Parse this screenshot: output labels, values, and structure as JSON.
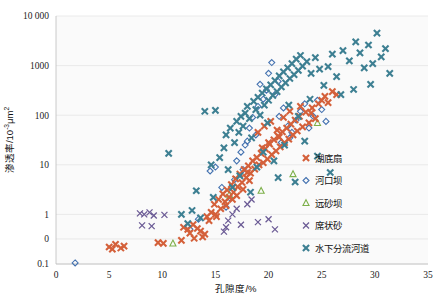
{
  "chart_data": {
    "type": "scatter",
    "title": "",
    "xlabel": "孔隙度/%",
    "ylabel": "渗透率/10⁻³μm²",
    "ylabel_base": "渗透率/10",
    "ylabel_exp": "-3",
    "ylabel_unit": "μm",
    "ylabel_unit_exp": "2",
    "xlim": [
      0,
      35
    ],
    "ylim": [
      0.1,
      10000
    ],
    "yscale": "log",
    "xscale": "linear",
    "grid": "horizontal",
    "legend_position": "right-center",
    "xticks": [
      "0",
      "5",
      "10",
      "15",
      "20",
      "25",
      "30",
      "35"
    ],
    "xtick_values": [
      0,
      5,
      10,
      15,
      20,
      25,
      30,
      35
    ],
    "yticks": [
      "10 000",
      "1000",
      "100",
      "10",
      "1",
      "0",
      "0.1"
    ],
    "ytick_values": [
      10000,
      1000,
      100,
      10,
      1,
      0.32,
      0.1
    ],
    "series": [
      {
        "name": "湖底扇",
        "marker": "heavy-x",
        "color": "#d4603a",
        "points": [
          [
            5.0,
            0.22
          ],
          [
            5.3,
            0.2
          ],
          [
            5.6,
            0.25
          ],
          [
            6.1,
            0.21
          ],
          [
            6.4,
            0.23
          ],
          [
            9.6,
            0.27
          ],
          [
            10.1,
            0.26
          ],
          [
            12.0,
            0.55
          ],
          [
            12.4,
            0.5
          ],
          [
            12.9,
            0.62
          ],
          [
            13.3,
            0.52
          ],
          [
            13.6,
            0.46
          ],
          [
            14.0,
            0.4
          ],
          [
            14.4,
            0.75
          ],
          [
            14.6,
            1.1
          ],
          [
            14.9,
            1.6
          ],
          [
            15.1,
            0.9
          ],
          [
            15.3,
            2.0
          ],
          [
            15.5,
            1.3
          ],
          [
            15.7,
            2.6
          ],
          [
            15.9,
            1.8
          ],
          [
            16.1,
            3.1
          ],
          [
            16.3,
            2.2
          ],
          [
            16.5,
            4.0
          ],
          [
            16.7,
            2.8
          ],
          [
            16.9,
            5.2
          ],
          [
            17.1,
            3.6
          ],
          [
            17.3,
            6.5
          ],
          [
            17.5,
            4.4
          ],
          [
            17.7,
            8.0
          ],
          [
            17.9,
            5.5
          ],
          [
            18.1,
            9.5
          ],
          [
            18.3,
            6.8
          ],
          [
            18.5,
            12
          ],
          [
            18.7,
            8.2
          ],
          [
            18.9,
            14
          ],
          [
            19.1,
            10
          ],
          [
            19.3,
            17
          ],
          [
            19.5,
            11
          ],
          [
            19.7,
            21
          ],
          [
            19.9,
            13
          ],
          [
            20.1,
            26
          ],
          [
            20.3,
            16
          ],
          [
            20.5,
            32
          ],
          [
            20.7,
            19
          ],
          [
            20.9,
            38
          ],
          [
            21.1,
            23
          ],
          [
            21.3,
            46
          ],
          [
            21.5,
            28
          ],
          [
            21.7,
            55
          ],
          [
            21.9,
            33
          ],
          [
            22.1,
            66
          ],
          [
            22.3,
            40
          ],
          [
            22.5,
            80
          ],
          [
            22.7,
            48
          ],
          [
            22.9,
            95
          ],
          [
            23.2,
            58
          ],
          [
            23.5,
            115
          ],
          [
            23.8,
            70
          ],
          [
            24.1,
            140
          ],
          [
            24.4,
            85
          ],
          [
            24.7,
            170
          ],
          [
            25.0,
            200
          ],
          [
            25.3,
            240
          ],
          [
            25.6,
            180
          ],
          [
            26.0,
            300
          ],
          [
            26.4,
            260
          ],
          [
            14.2,
            0.9
          ],
          [
            15.0,
            1.0
          ],
          [
            13.0,
            0.33
          ],
          [
            11.8,
            0.3
          ],
          [
            19.0,
            45
          ],
          [
            19.6,
            60
          ],
          [
            20.2,
            75
          ],
          [
            20.8,
            50
          ],
          [
            21.4,
            90
          ],
          [
            17.0,
            2.4
          ],
          [
            17.6,
            3.2
          ],
          [
            18.2,
            4.8
          ],
          [
            16.0,
            1.5
          ],
          [
            16.6,
            2.0
          ],
          [
            13.8,
            0.35
          ],
          [
            12.6,
            0.42
          ],
          [
            22.0,
            120
          ],
          [
            23.0,
            150
          ],
          [
            24.0,
            110
          ],
          [
            20.0,
            28
          ],
          [
            21.0,
            36
          ],
          [
            18.0,
            7.0
          ],
          [
            19.4,
            22
          ]
        ]
      },
      {
        "name": "河口坝",
        "marker": "diamond-open",
        "color": "#4472b0",
        "points": [
          [
            1.8,
            0.105
          ],
          [
            12.6,
            0.5
          ],
          [
            14.5,
            7.5
          ],
          [
            15.0,
            9.0
          ],
          [
            16.0,
            1.4
          ],
          [
            16.4,
            2.1
          ],
          [
            17.0,
            12
          ],
          [
            17.4,
            18
          ],
          [
            17.6,
            8.0
          ],
          [
            18.0,
            30
          ],
          [
            18.2,
            55
          ],
          [
            18.5,
            90
          ],
          [
            19.0,
            150
          ],
          [
            19.2,
            420
          ],
          [
            19.5,
            210
          ],
          [
            20.0,
            700
          ],
          [
            20.3,
            1150
          ],
          [
            20.6,
            260
          ],
          [
            21.0,
            95
          ],
          [
            21.4,
            140
          ],
          [
            21.8,
            60
          ],
          [
            22.2,
            45
          ],
          [
            22.6,
            80
          ],
          [
            23.0,
            120
          ],
          [
            23.4,
            170
          ],
          [
            23.8,
            55
          ],
          [
            24.2,
            95
          ],
          [
            24.6,
            200
          ],
          [
            25.0,
            130
          ],
          [
            25.4,
            75
          ],
          [
            15.6,
            3.5
          ],
          [
            16.8,
            5.0
          ],
          [
            18.8,
            40
          ],
          [
            19.8,
            320
          ],
          [
            20.9,
            480
          ],
          [
            22.0,
            35
          ],
          [
            13.4,
            0.8
          ],
          [
            17.8,
            25
          ],
          [
            21.2,
            28
          ]
        ]
      },
      {
        "name": "远砂坝",
        "marker": "triangle-open",
        "color": "#7db04a",
        "points": [
          [
            11.0,
            0.26
          ],
          [
            16.3,
            2.5
          ],
          [
            19.3,
            3.0
          ],
          [
            22.3,
            6.5
          ],
          [
            24.6,
            70
          ]
        ]
      },
      {
        "name": "席状砂",
        "marker": "thin-x",
        "color": "#6b5b95",
        "points": [
          [
            7.9,
            1.05
          ],
          [
            8.3,
            1.0
          ],
          [
            8.8,
            1.1
          ],
          [
            9.2,
            0.95
          ],
          [
            8.1,
            0.6
          ],
          [
            9.0,
            0.58
          ],
          [
            10.2,
            0.98
          ],
          [
            16.2,
            0.75
          ],
          [
            16.6,
            1.0
          ],
          [
            17.0,
            1.3
          ],
          [
            16.0,
            0.55
          ],
          [
            17.4,
            0.62
          ],
          [
            18.0,
            1.6
          ],
          [
            18.4,
            2.0
          ],
          [
            15.8,
            0.45
          ],
          [
            19.0,
            0.7
          ],
          [
            20.0,
            0.8
          ],
          [
            20.6,
            0.5
          ]
        ]
      },
      {
        "name": "水下分流河道",
        "marker": "heavy-x",
        "color": "#3d7f92",
        "points": [
          [
            10.6,
            17
          ],
          [
            14.0,
            120
          ],
          [
            15.0,
            125
          ],
          [
            16.0,
            40
          ],
          [
            16.4,
            55
          ],
          [
            16.8,
            28
          ],
          [
            17.0,
            75
          ],
          [
            17.2,
            45
          ],
          [
            17.4,
            95
          ],
          [
            17.6,
            60
          ],
          [
            17.8,
            110
          ],
          [
            18.0,
            150
          ],
          [
            18.2,
            85
          ],
          [
            18.4,
            35
          ],
          [
            18.6,
            190
          ],
          [
            18.8,
            130
          ],
          [
            19.0,
            230
          ],
          [
            19.2,
            100
          ],
          [
            19.4,
            280
          ],
          [
            19.6,
            160
          ],
          [
            19.8,
            340
          ],
          [
            20.0,
            200
          ],
          [
            20.2,
            410
          ],
          [
            20.4,
            250
          ],
          [
            20.6,
            500
          ],
          [
            20.8,
            300
          ],
          [
            21.0,
            620
          ],
          [
            21.2,
            370
          ],
          [
            21.4,
            750
          ],
          [
            21.6,
            450
          ],
          [
            21.8,
            900
          ],
          [
            22.0,
            550
          ],
          [
            22.2,
            1100
          ],
          [
            22.4,
            660
          ],
          [
            22.6,
            1350
          ],
          [
            22.8,
            800
          ],
          [
            23.0,
            1600
          ],
          [
            23.2,
            980
          ],
          [
            23.6,
            1200
          ],
          [
            24.0,
            700
          ],
          [
            24.4,
            1450
          ],
          [
            24.8,
            850
          ],
          [
            25.2,
            400
          ],
          [
            25.6,
            950
          ],
          [
            26.0,
            1700
          ],
          [
            26.4,
            600
          ],
          [
            27.0,
            2000
          ],
          [
            27.6,
            1250
          ],
          [
            28.2,
            3000
          ],
          [
            28.6,
            1800
          ],
          [
            29.0,
            900
          ],
          [
            29.4,
            2600
          ],
          [
            29.8,
            1100
          ],
          [
            30.2,
            4500
          ],
          [
            30.6,
            1500
          ],
          [
            31.0,
            2200
          ],
          [
            31.4,
            700
          ],
          [
            13.2,
            3.0
          ],
          [
            14.6,
            10
          ],
          [
            15.4,
            14
          ],
          [
            15.8,
            22
          ],
          [
            16.2,
            8.0
          ],
          [
            19.5,
            18
          ],
          [
            20.5,
            12
          ],
          [
            21.5,
            25
          ],
          [
            12.8,
            1.2
          ],
          [
            17.3,
            6.0
          ],
          [
            18.9,
            9.0
          ],
          [
            26.8,
            260
          ],
          [
            28.0,
            330
          ],
          [
            29.6,
            420
          ],
          [
            22.5,
            4.5
          ],
          [
            23.4,
            30
          ],
          [
            24.6,
            15
          ],
          [
            25.8,
            7.0
          ],
          [
            16.6,
            3.5
          ],
          [
            18.3,
            2.8
          ],
          [
            20.9,
            5.5
          ],
          [
            11.8,
            1.0
          ],
          [
            12.4,
            0.65
          ],
          [
            19.9,
            70
          ],
          [
            22.8,
            95
          ],
          [
            14.8,
            2.2
          ],
          [
            13.6,
            0.85
          ],
          [
            21.9,
            160
          ],
          [
            23.9,
            210
          ]
        ]
      }
    ]
  }
}
